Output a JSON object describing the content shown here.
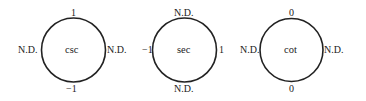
{
  "diagrams": [
    {
      "name": "csc",
      "center_label": "csc",
      "top": "1",
      "bottom": "−1",
      "left": "N.D.",
      "right": "N.D.",
      "cx": 73.5,
      "cy": 50,
      "r": 32
    },
    {
      "name": "sec",
      "center_label": "sec",
      "top": "N.D.",
      "bottom": "N.D.",
      "left": "−1",
      "right": "1",
      "cx": 184.5,
      "cy": 50,
      "r": 32
    },
    {
      "name": "cot",
      "center_label": "cot",
      "top": "0",
      "bottom": "0",
      "left": "N.D.",
      "right": "N.D.",
      "cx": 291.5,
      "cy": 50,
      "r": 31.5
    }
  ],
  "colors": {
    "stroke": "#222222",
    "text": "#222222",
    "background": "#ffffff"
  }
}
